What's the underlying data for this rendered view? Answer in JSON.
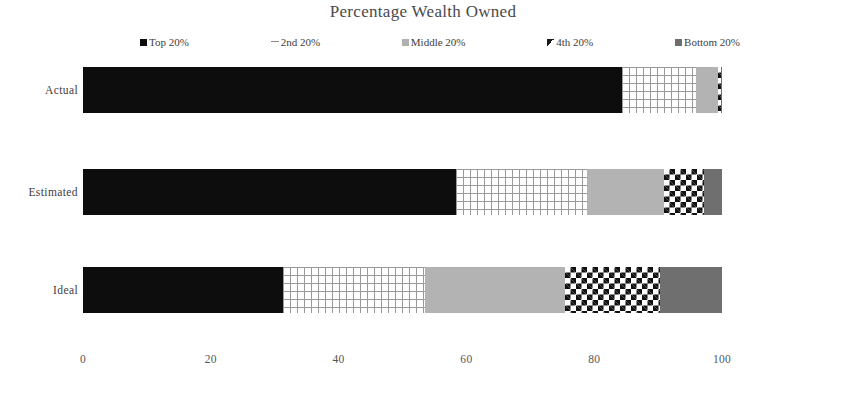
{
  "chart_data": {
    "type": "bar",
    "orientation": "horizontal",
    "stacked": true,
    "title": "Percentage Wealth Owned",
    "xlabel": "",
    "ylabel": "",
    "xlim": [
      0,
      120
    ],
    "grid": false,
    "legend_position": "top",
    "categories": [
      "Actual",
      "Estimated",
      "Ideal"
    ],
    "xticks": [
      "0",
      "20",
      "40",
      "60",
      "80",
      "100",
      "1"
    ],
    "xtick_values": [
      0,
      20,
      40,
      60,
      80,
      100,
      120
    ],
    "series": [
      {
        "name": "Top 20%",
        "values": [
          84.3,
          58.3,
          31.3
        ],
        "color": "#0d0d0d",
        "pattern": "solid-black"
      },
      {
        "name": "2nd 20%",
        "values": [
          11.7,
          20.5,
          22.2
        ],
        "color": "#ffffff",
        "pattern": "brick"
      },
      {
        "name": "Middle 20%",
        "values": [
          3.3,
          12.1,
          21.9
        ],
        "color": "#b3b3b3",
        "pattern": "solid-light-gray"
      },
      {
        "name": "4th 20%",
        "values": [
          0.5,
          6.3,
          14.9
        ],
        "color": "#111111",
        "pattern": "checkerboard"
      },
      {
        "name": "Bottom 20%",
        "values": [
          0.2,
          2.8,
          9.7
        ],
        "color": "#6f6f6f",
        "pattern": "solid-dark-gray"
      }
    ]
  },
  "legend": {
    "items": [
      {
        "label": "Top 20%",
        "swatch": "legend-swatch-top-20"
      },
      {
        "label": "2nd 20%",
        "swatch": "legend-swatch-2nd-20"
      },
      {
        "label": "Middle 20%",
        "swatch": "legend-swatch-middle-20"
      },
      {
        "label": "4th 20%",
        "swatch": "legend-swatch-4th-20"
      },
      {
        "label": "Bottom 20%",
        "swatch": "legend-swatch-bottom-20"
      }
    ]
  }
}
